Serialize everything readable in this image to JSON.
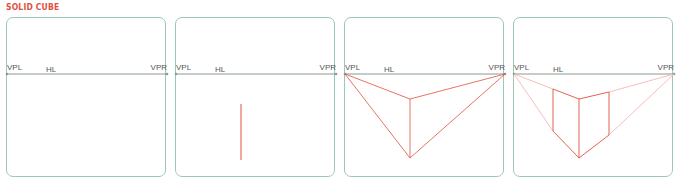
{
  "title": "SOLID CUBE",
  "colors": {
    "accent": "#e0503f",
    "border": "#9ec7bb",
    "horizon": "#8a9a96"
  },
  "labels": {
    "vpl": "VPL",
    "hl": "HL",
    "vpr": "VPR"
  },
  "panels": [
    {
      "step": 1,
      "description": "Horizon line with left and right vanishing points"
    },
    {
      "step": 2,
      "description": "Vertical front edge drawn"
    },
    {
      "step": 3,
      "description": "Lines from edge ends to vanishing points"
    },
    {
      "step": 4,
      "description": "Side verticals added forming solid cube"
    }
  ]
}
